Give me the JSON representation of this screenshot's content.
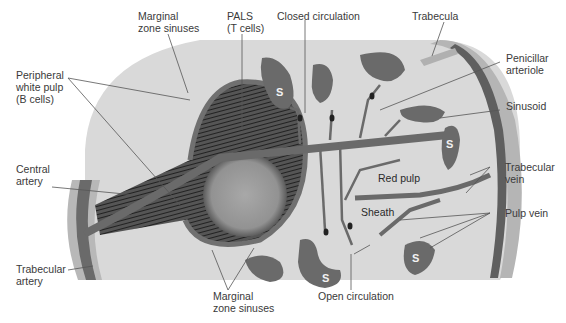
{
  "figure": {
    "colors": {
      "background": "#ffffff",
      "red_pulp": "#d8d8d8",
      "vessel": "#6a6a6a",
      "white_pulp_hatch": "#3a3a3a",
      "germinal_center": "#9a9a9a",
      "trabecula_light": "#b8b8b8",
      "label_text": "#3a3a3a",
      "leader_line": "#555555"
    },
    "sinusoid_marker": "S",
    "labels": {
      "marginal_zone_top": "Marginal\nzone sinuses",
      "pals": "PALS\n(T cells)",
      "closed_circulation": "Closed circulation",
      "trabecula": "Trabecula",
      "peripheral_white_pulp": "Peripheral\nwhite pulp\n(B cells)",
      "penicillar_arteriole": "Penicillar\narteriole",
      "sinusoid": "Sinusoid",
      "central_artery": "Central\nartery",
      "red_pulp": "Red pulp",
      "trabecular_vein": "Trabecular\nvein",
      "sheath": "Sheath",
      "pulp_vein": "Pulp vein",
      "trabecular_artery": "Trabecular\nartery",
      "marginal_zone_bottom": "Marginal\nzone sinuses",
      "open_circulation": "Open circulation"
    }
  }
}
